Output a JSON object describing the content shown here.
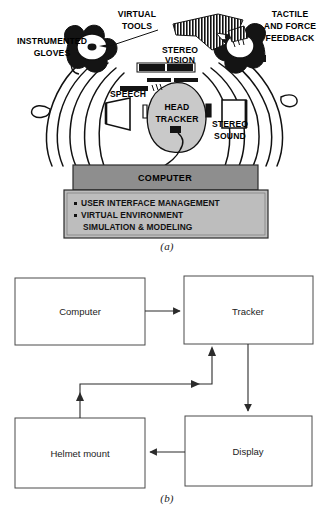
{
  "figure": {
    "panels": [
      {
        "id": "a",
        "label": "(a)",
        "caption_label": "(a)"
      },
      {
        "id": "b",
        "label": "(b)",
        "caption_label": "(b)"
      }
    ]
  },
  "panel_a": {
    "title_label": "(a)",
    "callouts": [
      {
        "key": "instrumented_gloves",
        "lines": [
          "INSTRUMENTED",
          "GLOVES"
        ],
        "x": 52,
        "y": 44
      },
      {
        "key": "virtual_tools",
        "lines": [
          "VIRTUAL",
          "TOOLS"
        ],
        "x": 137,
        "y": 16
      },
      {
        "key": "stereo_vision",
        "lines": [
          "STEREO",
          "VISION"
        ],
        "x": 180,
        "y": 50
      },
      {
        "key": "tactile_and_force_feedback",
        "lines": [
          "TACTILE",
          "AND FORCE",
          "FEEDBACK"
        ],
        "x": 288,
        "y": 16
      },
      {
        "key": "speech",
        "lines": [
          "SPEECH"
        ],
        "x": 128,
        "y": 94
      },
      {
        "key": "head_tracker",
        "lines": [
          "HEAD",
          "TRACKER"
        ],
        "x": 176,
        "y": 108
      },
      {
        "key": "stereo_sound",
        "lines": [
          "STEREO",
          "SOUND"
        ],
        "x": 228,
        "y": 125
      }
    ],
    "computer_bar": {
      "label": "COMPUTER",
      "fill": "#8e8e8e"
    },
    "functions_box": {
      "fill": "#bdbdbd",
      "items": [
        {
          "bullet": true,
          "text": "USER INTERFACE MANAGEMENT"
        },
        {
          "bullet": true,
          "text": "VIRTUAL ENVIRONMENT"
        },
        {
          "bullet": false,
          "text": "SIMULATION & MODELING"
        }
      ]
    }
  },
  "panel_b": {
    "title_label": "(b)",
    "blocks": [
      {
        "key": "computer",
        "label": "Computer",
        "x": 15,
        "y": 20,
        "w": 130,
        "h": 67
      },
      {
        "key": "tracker",
        "label": "Tracker",
        "x": 184,
        "y": 18,
        "w": 129,
        "h": 68
      },
      {
        "key": "helmet_mount",
        "label": "Helmet mount",
        "x": 15,
        "y": 160,
        "w": 130,
        "h": 70
      },
      {
        "key": "display",
        "label": "Display",
        "x": 185,
        "y": 158,
        "w": 127,
        "h": 70
      }
    ],
    "edges": [
      {
        "key": "computer-to-tracker",
        "from": "computer",
        "to": "tracker",
        "direction": "right"
      },
      {
        "key": "tracker-to-display",
        "from": "tracker",
        "to": "display",
        "direction": "down"
      },
      {
        "key": "display-to-helmet-mount",
        "from": "display",
        "to": "helmet_mount",
        "direction": "left"
      },
      {
        "key": "helmet-mount-to-tracker",
        "from": "helmet_mount",
        "to": "tracker",
        "direction": "up-right-up"
      }
    ]
  },
  "colors": {
    "ink": "#111111",
    "background": "#ffffff",
    "computer_bar_fill": "#8e8e8e",
    "functions_box_fill": "#bdbdbd",
    "block_stroke": "#4a4a4a",
    "head_fill": "#c9c9c9"
  }
}
